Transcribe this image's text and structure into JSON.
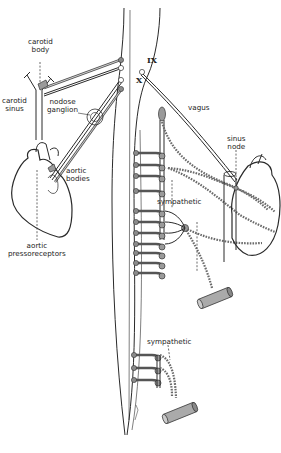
{
  "figure": {
    "labels": {
      "carotid_body": "carotid\nbody",
      "carotid_body_l1": "carotid",
      "carotid_body_l2": "body",
      "carotid_sinus_l1": "carotid",
      "carotid_sinus_l2": "sinus",
      "nodose_l1": "nodose",
      "nodose_l2": "ganglion",
      "aortic_bodies_l1": "aortic",
      "aortic_bodies_l2": "bodies",
      "aortic_press_l1": "aortic",
      "aortic_press_l2": "pressoreceptors",
      "vagus": "vagus",
      "sinus_node_l1": "sinus",
      "sinus_node_l2": "node",
      "sympathetic_upper": "sympathetic",
      "sympathetic_lower": "sympathetic"
    },
    "cranial_nerves": {
      "ix": "IX",
      "x": "X"
    }
  }
}
